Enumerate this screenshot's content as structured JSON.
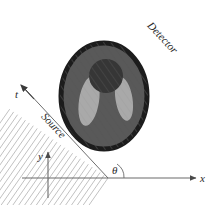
{
  "figure": {
    "type": "diagram",
    "background_color": "#ffffff"
  },
  "labels": {
    "detector": "Detector",
    "source": "Source",
    "t_axis": "t",
    "x_axis": "x",
    "y_axis": "y",
    "angle": "θ"
  },
  "geometry": {
    "beam_angle_deg": 35,
    "ray_count": 26,
    "detector_element_count": 26,
    "origin": {
      "x": 108,
      "y": 178
    },
    "x_axis_end": {
      "x": 200,
      "y": 178
    },
    "y_axis_end": {
      "x": 48,
      "y": 152
    },
    "t_axis_arrow_tip": {
      "x": 20,
      "y": 84
    },
    "source_line_start": {
      "x": 108,
      "y": 178
    },
    "source_line_end": {
      "x": 24,
      "y": 88
    },
    "detector_line_start": {
      "x": 125,
      "y": 14
    },
    "detector_line_end": {
      "x": 205,
      "y": 100
    }
  },
  "phantom": {
    "outer_ellipse": {
      "name": "head-outline",
      "cx": 104,
      "cy": 96,
      "rx": 44,
      "ry": 54,
      "fill": "#585858",
      "stroke": "#1d1d1d",
      "stroke_width": 5
    },
    "inner_circle": {
      "name": "dark-blob",
      "cx": 106,
      "cy": 76,
      "r": 17,
      "fill": "#363636"
    },
    "left_ellipse": {
      "name": "light-ventricle-left",
      "cx": 89,
      "cy": 100,
      "rx": 10,
      "ry": 24,
      "rotation_deg": 10,
      "fill": "#a9a9a9"
    },
    "right_ellipse": {
      "name": "light-ventricle-right",
      "cx": 124,
      "cy": 100,
      "rx": 8,
      "ry": 22,
      "rotation_deg": -10,
      "fill": "#a9a9a9"
    }
  },
  "colors": {
    "ray_line": "#b9b9b9",
    "detector_dot": "#1a1a1a",
    "axis": "#5a5a5a",
    "text": "#2b2b2b",
    "hatch": "#4a4a4a"
  }
}
